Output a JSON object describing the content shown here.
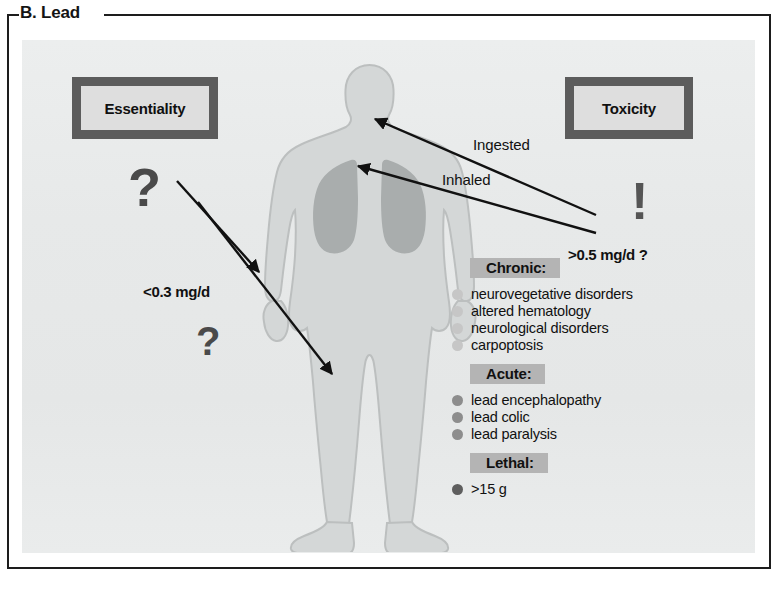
{
  "panel": {
    "title": "B. Lead"
  },
  "boxes": {
    "essentiality": "Essentiality",
    "toxicity": "Toxicity"
  },
  "marks": {
    "question_top": "?",
    "question_bottom": "?",
    "exclamation": "!"
  },
  "doses": {
    "essential_dose": "<0.3 mg/d",
    "toxic_dose": ">0.5 mg/d ?"
  },
  "routes": {
    "ingested": "Ingested",
    "inhaled": "Inhaled"
  },
  "effects": [
    {
      "heading": "Chronic:",
      "bullet_color": "#c6c6c6",
      "items": [
        "neurovegetative disorders",
        "altered hematology",
        "neurological disorders",
        "carpoptosis"
      ]
    },
    {
      "heading": "Acute:",
      "bullet_color": "#8d8d8d",
      "items": [
        "lead encephalopathy",
        "lead colic",
        "lead paralysis"
      ]
    },
    {
      "heading": "Lethal:",
      "bullet_color": "#5e5e5e",
      "items": [
        ">15 g"
      ]
    }
  ],
  "figure": {
    "body_label": "human-body-silhouette",
    "organ_label": "lungs",
    "body_color": "#d4d7d7",
    "body_outline": "#b9bcbc",
    "lungs_color": "#a9adad"
  },
  "colors": {
    "frame": "#1d1d1d",
    "panel_bg": "#e8eaea",
    "box_border": "#5c5c5c",
    "box_fill": "#dedede",
    "heading_band": "#b4b4b4",
    "arrow": "#111111",
    "mark": "#4a4a4a"
  }
}
